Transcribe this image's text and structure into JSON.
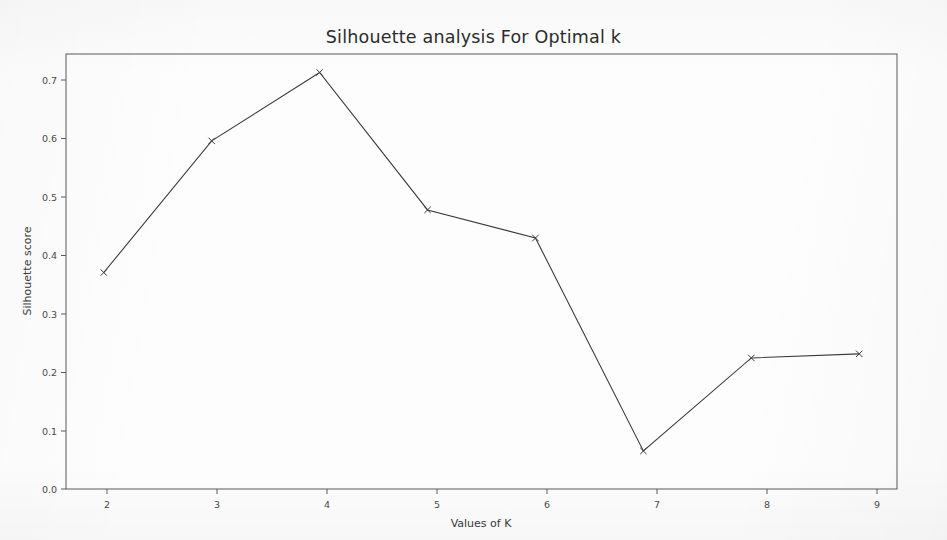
{
  "chart_data": {
    "type": "line",
    "title": "Silhouette analysis For Optimal k",
    "xlabel": "Values of K",
    "ylabel": "Silhouette score",
    "x": [
      2,
      3,
      4,
      5,
      6,
      7,
      8,
      9
    ],
    "values": [
      0.37,
      0.595,
      0.712,
      0.477,
      0.429,
      0.065,
      0.224,
      0.231
    ],
    "categories": [
      "2",
      "3",
      "4",
      "5",
      "6",
      "7",
      "8",
      "9"
    ],
    "xticklabels": [
      "2",
      "3",
      "4",
      "5",
      "6",
      "7",
      "8",
      "9"
    ],
    "yticks": [
      0.0,
      0.1,
      0.2,
      0.3,
      0.4,
      0.5,
      0.6,
      0.7
    ],
    "yticklabels": [
      "0.0",
      "0.1",
      "0.2",
      "0.3",
      "0.4",
      "0.5",
      "0.6",
      "0.7"
    ],
    "xlim": [
      1.65,
      9.35
    ],
    "ylim": [
      0.0,
      0.7435
    ],
    "grid": false,
    "legend": null,
    "series": [
      {
        "name": "silhouette",
        "values": [
          0.37,
          0.595,
          0.712,
          0.477,
          0.429,
          0.065,
          0.224,
          0.231
        ],
        "color": "#3b3b3b",
        "marker": "x",
        "linewidth": 1
      }
    ]
  },
  "figure": {
    "background_color": "#fdfdfd",
    "axes_frame_color": "#5a5a5a",
    "tick_label_color": "#4a4a4a",
    "title_color": "#2c2c2c"
  }
}
